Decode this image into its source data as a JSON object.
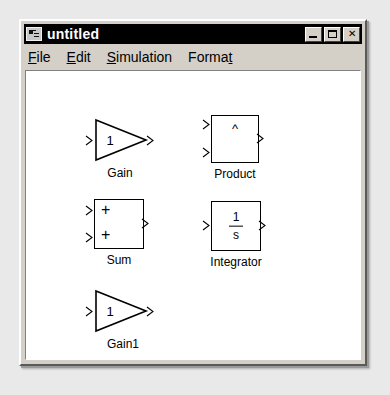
{
  "window": {
    "title": "untitled",
    "icon": "simulink-model-icon",
    "controls": [
      {
        "name": "minimize",
        "glyph": "_"
      },
      {
        "name": "maximize",
        "glyph": "□"
      },
      {
        "name": "close",
        "glyph": "✕"
      }
    ]
  },
  "menu": {
    "items": [
      {
        "label": "File",
        "accel_prefix": "F",
        "accel_suffix": "ile",
        "accel_position": "first"
      },
      {
        "label": "Edit",
        "accel_prefix": "E",
        "accel_suffix": "dit",
        "accel_position": "first"
      },
      {
        "label": "Simulation",
        "accel_prefix": "S",
        "accel_suffix": "imulation",
        "accel_position": "first"
      },
      {
        "label": "Format",
        "accel_prefix": "Forma",
        "accel_suffix": "t",
        "accel_position": "last"
      }
    ]
  },
  "canvas": {
    "background_color": "#ffffff",
    "blocks": [
      {
        "id": "gain",
        "type": "triangle",
        "label": "Gain",
        "inner_text": "1",
        "inputs": 1,
        "outputs": 1
      },
      {
        "id": "product",
        "type": "square",
        "label": "Product",
        "inner_text": "^",
        "inputs": 2,
        "outputs": 1
      },
      {
        "id": "sum",
        "type": "square",
        "label": "Sum",
        "signs": [
          "+",
          "+"
        ],
        "inputs": 2,
        "outputs": 1
      },
      {
        "id": "integrator",
        "type": "square",
        "label": "Integrator",
        "numerator": "1",
        "denominator": "s",
        "inputs": 1,
        "outputs": 1
      },
      {
        "id": "gain1",
        "type": "triangle",
        "label": "Gain1",
        "inner_text": "1",
        "inputs": 1,
        "outputs": 1
      }
    ]
  },
  "colors": {
    "window_face": "#d4d0c8",
    "title_bar": "#000000",
    "title_text": "#ffffff",
    "canvas": "#ffffff",
    "line": "#000000",
    "page_background": "#e9e9e9"
  }
}
